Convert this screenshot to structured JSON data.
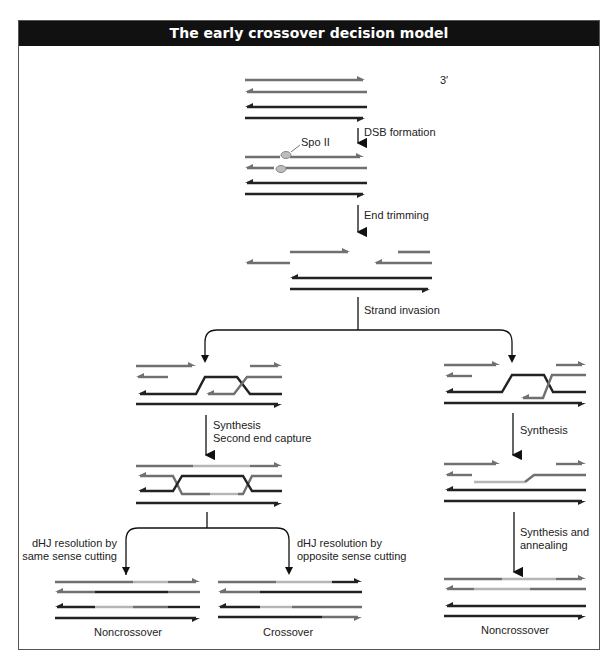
{
  "title": "The early crossover decision model",
  "labels": {
    "three_prime": "3′",
    "dsb_formation": "DSB formation",
    "spo11": "Spo II",
    "end_trimming": "End trimming",
    "strand_invasion": "Strand invasion",
    "synthesis_left_1": "Synthesis",
    "synthesis_left_2": "Second end capture",
    "synthesis_right": "Synthesis",
    "same_sense_1": "dHJ resolution by",
    "same_sense_2": "same sense cutting",
    "opposite_sense_1": "dHJ resolution by",
    "opposite_sense_2": "opposite sense cutting",
    "annealing_1": "Synthesis and",
    "annealing_2": "annealing",
    "outcome_left": "Noncrossover",
    "outcome_middle": "Crossover",
    "outcome_right": "Noncrossover"
  },
  "colors": {
    "header_bg": "#111111",
    "strand_gray": "#707070",
    "strand_dark": "#222222",
    "strand_new": "#b5b5b5",
    "spo11": "#bdbdbd"
  }
}
